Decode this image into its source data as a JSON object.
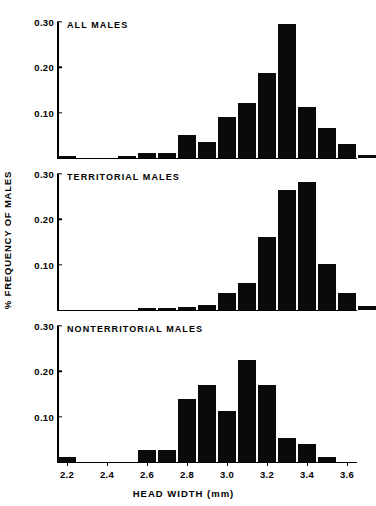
{
  "chart_data": {
    "type": "bar",
    "title": "",
    "xlabel": "HEAD WIDTH  (mm)",
    "ylabel": "% FREQUENCY OF MALES",
    "xlim": [
      2.15,
      3.65
    ],
    "ylim": [
      0,
      0.3
    ],
    "bin_width": 0.1,
    "grid": false,
    "legend": "none",
    "xticks": [
      "2.2",
      "2.4",
      "2.6",
      "2.8",
      "3.0",
      "3.2",
      "3.4",
      "3.6"
    ],
    "xtick_values": [
      2.2,
      2.4,
      2.6,
      2.8,
      3.0,
      3.2,
      3.4,
      3.6
    ],
    "yticks": [
      "0.10",
      "0.20",
      "0.30"
    ],
    "ytick_values": [
      0.1,
      0.2,
      0.3
    ],
    "x": [
      2.2,
      2.3,
      2.4,
      2.5,
      2.6,
      2.7,
      2.8,
      2.9,
      3.0,
      3.1,
      3.2,
      3.3,
      3.4,
      3.5,
      3.6
    ],
    "panels": [
      {
        "name": "all-males",
        "label": "ALL MALES",
        "values": [
          0.005,
          0.0,
          0.0,
          0.005,
          0.01,
          0.012,
          0.05,
          0.035,
          0.09,
          0.122,
          0.188,
          0.295,
          0.112,
          0.067,
          0.03,
          0.006
        ]
      },
      {
        "name": "territorial-males",
        "label": "TERRITORIAL MALES",
        "values": [
          0.0,
          0.0,
          0.0,
          0.0,
          0.005,
          0.005,
          0.006,
          0.01,
          0.037,
          0.06,
          0.16,
          0.265,
          0.283,
          0.101,
          0.037,
          0.009
        ]
      },
      {
        "name": "nonterritorial-males",
        "label": "NONTERRITORIAL MALES",
        "values": [
          0.011,
          0.0,
          0.0,
          0.0,
          0.027,
          0.026,
          0.14,
          0.17,
          0.112,
          0.224,
          0.17,
          0.054,
          0.04,
          0.011,
          0.0,
          0.0
        ]
      }
    ]
  },
  "colors": {
    "bar": "#0a0a0a",
    "axis": "#000000",
    "background": "#ffffff"
  }
}
